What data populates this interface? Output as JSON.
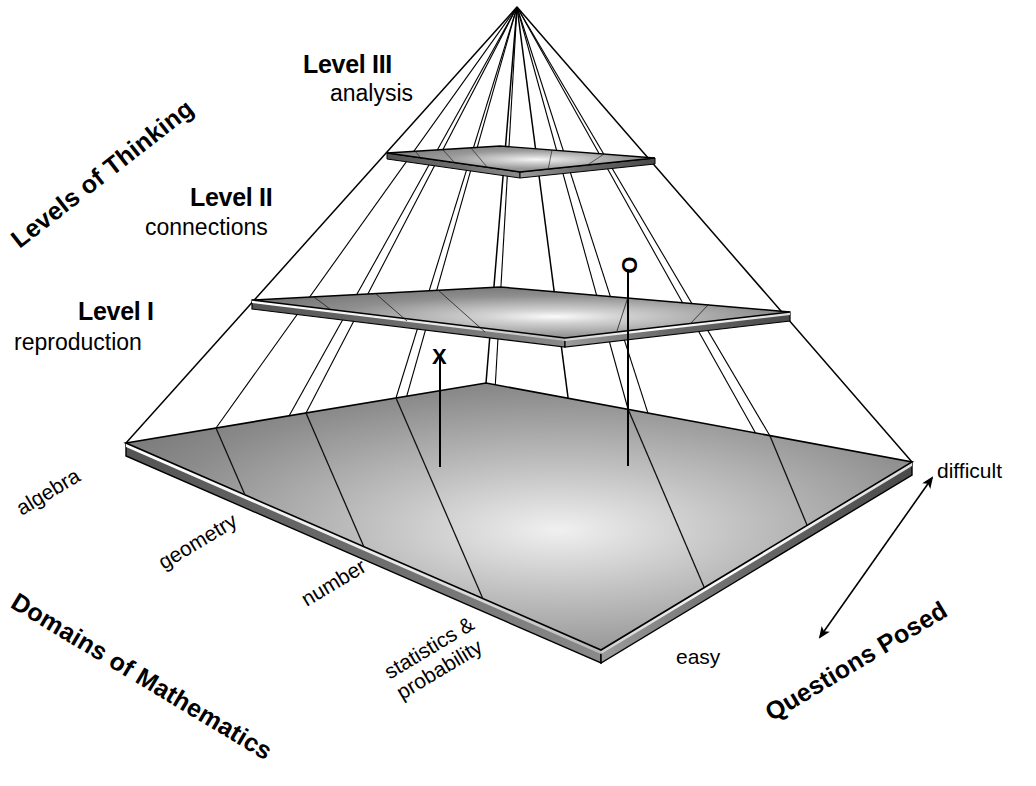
{
  "diagram": {
    "title_implicit": "Mathematics assessment framework pyramid",
    "axes": {
      "vertical": {
        "name": "Levels of Thinking",
        "rotation_deg": -38,
        "levels": [
          {
            "id": "level-3",
            "title": "Level III",
            "subtitle": "analysis"
          },
          {
            "id": "level-2",
            "title": "Level II",
            "subtitle": "connections"
          },
          {
            "id": "level-1",
            "title": "Level I",
            "subtitle": "reproduction"
          }
        ]
      },
      "depth": {
        "name": "Domains of Mathematics",
        "rotation_deg": 31,
        "categories": [
          "algebra",
          "geometry",
          "number",
          "statistics &\nprobability"
        ]
      },
      "difficulty": {
        "name": "Questions Posed",
        "rotation_deg": -31,
        "low_label": "easy",
        "high_label": "difficult",
        "arrow": "double-headed"
      }
    },
    "markers": [
      {
        "id": "marker-x",
        "glyph": "X",
        "description": "item plotted in algebra domain at level I"
      },
      {
        "id": "marker-o",
        "glyph": "O",
        "description": "item plotted at level II toward difficult end"
      }
    ],
    "grid": {
      "domain_divisions": 4,
      "difficulty_divisions": 3
    },
    "colors": {
      "slab_top_mid": "#8d8d8d",
      "slab_top_light": "#f2f2f2",
      "slab_top_dark": "#6e6e6e",
      "slab_edge_dark": "#4f4f4f",
      "slab_edge_light": "#d8d8d8",
      "outline": "#000000",
      "background": "#ffffff"
    }
  }
}
